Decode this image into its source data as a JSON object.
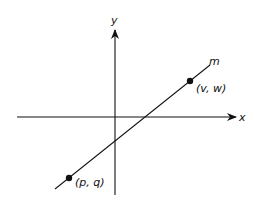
{
  "diagram": {
    "type": "coordinate-plane",
    "axes": {
      "x_label": "x",
      "y_label": "y"
    },
    "line": {
      "label": "m"
    },
    "points": [
      {
        "label": "(v, w)"
      },
      {
        "label": "(p, q)"
      }
    ],
    "colors": {
      "stroke": "#111111",
      "background": "#ffffff"
    }
  }
}
